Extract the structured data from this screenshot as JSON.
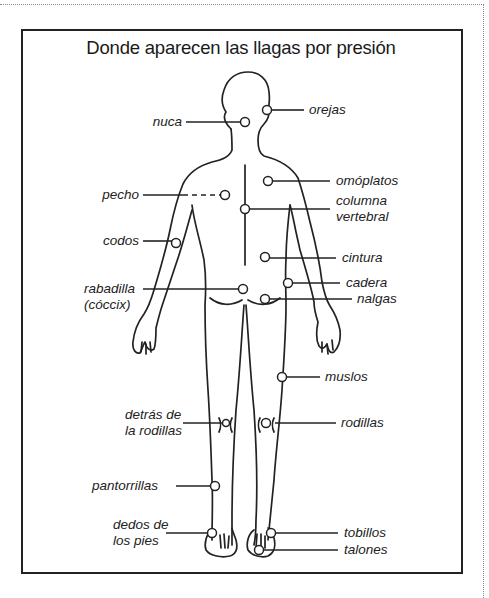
{
  "title": "Donde aparecen las llagas por presión",
  "labels": {
    "orejas": "orejas",
    "nuca": "nuca",
    "omoplatos": "omóplatos",
    "pecho": "pecho",
    "columna_1": "columna",
    "columna_2": "vertebral",
    "codos": "codos",
    "cintura": "cintura",
    "rabadilla_1": "rabadilla",
    "rabadilla_2": "(cóccix)",
    "cadera": "cadera",
    "nalgas": "nalgas",
    "muslos": "muslos",
    "detras_1": "detrás de",
    "detras_2": "la rodillas",
    "rodillas": "rodillas",
    "pantorrillas": "pantorrillas",
    "dedos_1": "dedos de",
    "dedos_2": "los pies",
    "tobillos": "tobillos",
    "talones": "talones"
  },
  "colors": {
    "ink": "#222222",
    "background": "#ffffff"
  }
}
